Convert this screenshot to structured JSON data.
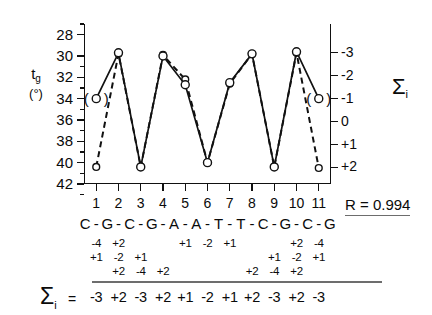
{
  "axes": {
    "y_left_title_main": "t",
    "y_left_title_sub": "g",
    "y_left_title_unit": "(°)",
    "y_left_ticks": [
      "42",
      "40",
      "38",
      "36",
      "34",
      "32",
      "30",
      "28"
    ],
    "y_right_ticks": [
      "+2",
      "+1",
      "0",
      "-1",
      "-2",
      "-3"
    ],
    "y_right_title": "Σ",
    "y_right_title_sub": "i",
    "x_ticks": [
      "1",
      "2",
      "3",
      "4",
      "5",
      "6",
      "7",
      "8",
      "9",
      "10",
      "11"
    ]
  },
  "sequence": {
    "bases": [
      "C",
      "G",
      "C",
      "G",
      "A",
      "A",
      "T",
      "T",
      "C",
      "G",
      "C",
      "G"
    ],
    "separator": "-"
  },
  "increment_rows": [
    {
      "row": 1,
      "entries": [
        {
          "pos": 1,
          "value": "-4"
        },
        {
          "pos": 2,
          "value": "+2"
        },
        {
          "pos": 5,
          "value": "+1"
        },
        {
          "pos": 6,
          "value": "-2"
        },
        {
          "pos": 7,
          "value": "+1"
        },
        {
          "pos": 10,
          "value": "+2"
        },
        {
          "pos": 11,
          "value": "-4"
        }
      ]
    },
    {
      "row": 2,
      "entries": [
        {
          "pos": 1,
          "value": "+1"
        },
        {
          "pos": 2,
          "value": "-2"
        },
        {
          "pos": 3,
          "value": "+1"
        },
        {
          "pos": 9,
          "value": "+1"
        },
        {
          "pos": 10,
          "value": "-2"
        },
        {
          "pos": 11,
          "value": "+1"
        }
      ]
    },
    {
      "row": 3,
      "entries": [
        {
          "pos": 2,
          "value": "+2"
        },
        {
          "pos": 3,
          "value": "-4"
        },
        {
          "pos": 4,
          "value": "+2"
        },
        {
          "pos": 8,
          "value": "+2"
        },
        {
          "pos": 9,
          "value": "-4"
        },
        {
          "pos": 10,
          "value": "+2"
        }
      ]
    }
  ],
  "sum_row": {
    "symbol": "Σ",
    "symbol_sub": "i",
    "equals": "=",
    "values": [
      "-3",
      "+2",
      "-3",
      "+2",
      "+1",
      "-2",
      "+1",
      "+2",
      "-3",
      "+2",
      "-3"
    ]
  },
  "correlation": {
    "label": "R = 0.994"
  },
  "chart_data": {
    "type": "line",
    "title": "",
    "xlabel": "",
    "ylabel": "t_g (°)",
    "y2label": "Σi",
    "x": [
      1,
      2,
      3,
      4,
      5,
      6,
      7,
      8,
      9,
      10,
      11
    ],
    "xticklabels": [
      "1",
      "2",
      "3",
      "4",
      "5",
      "6",
      "7",
      "8",
      "9",
      "10",
      "11"
    ],
    "ylim": [
      28,
      43
    ],
    "yticks": [
      28,
      30,
      32,
      34,
      36,
      38,
      40,
      42
    ],
    "y2lim": [
      -3.5,
      2.6
    ],
    "y2ticks": [
      -3,
      -2,
      -1,
      0,
      1,
      2
    ],
    "y2ticklabels": [
      "-3",
      "-2",
      "-1",
      "0",
      "+1",
      "+2"
    ],
    "grid": false,
    "legend": "none",
    "series": [
      {
        "name": "t_g measured (solid)",
        "style": "solid",
        "marker": "open-circle",
        "values": [
          36.0,
          40.3,
          29.6,
          40.0,
          37.3,
          30.0,
          37.5,
          40.2,
          29.6,
          40.4,
          36.0
        ],
        "parenthesized_points": [
          1,
          11
        ]
      },
      {
        "name": "Sigma_i calculated (dashed)",
        "style": "dashed",
        "marker": "open-circle",
        "values": [
          29.6,
          40.2,
          29.6,
          40.1,
          37.8,
          30.0,
          37.4,
          40.2,
          29.6,
          40.3,
          29.5
        ],
        "sigma_values": [
          -3,
          2,
          -3,
          2,
          1,
          -2,
          1,
          2,
          -3,
          2,
          -3
        ]
      }
    ],
    "annotations": [
      {
        "text": "R = 0.994",
        "position": "below-right"
      },
      {
        "text": "C-G-C-G-A-A-T-T-C-G-C-G",
        "position": "below-axis"
      }
    ]
  }
}
